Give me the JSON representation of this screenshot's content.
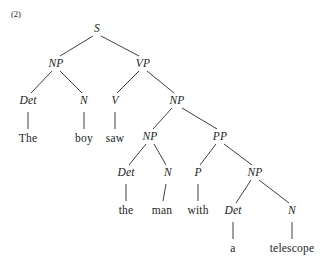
{
  "figure": {
    "example_number": "(2)",
    "sentence": "The boy saw the man with a telescope",
    "ink_color": "#1d1d1d",
    "line_color": "#2a2a2a",
    "background_color": "#ffffff"
  },
  "nodes": {
    "s": {
      "label": "S",
      "x": 97,
      "y": 29,
      "kind": "nonterminal"
    },
    "np1": {
      "label": "NP",
      "x": 56,
      "y": 64,
      "kind": "nonterminal"
    },
    "vp": {
      "label": "VP",
      "x": 143,
      "y": 64,
      "kind": "nonterminal"
    },
    "det1": {
      "label": "Det",
      "x": 28,
      "y": 101,
      "kind": "nonterminal"
    },
    "n1": {
      "label": "N",
      "x": 84,
      "y": 101,
      "kind": "nonterminal"
    },
    "v": {
      "label": "V",
      "x": 115,
      "y": 101,
      "kind": "nonterminal"
    },
    "np2": {
      "label": "NP",
      "x": 177,
      "y": 101,
      "kind": "nonterminal"
    },
    "the1": {
      "label": "The",
      "x": 28,
      "y": 139,
      "kind": "terminal"
    },
    "boy": {
      "label": "boy",
      "x": 84,
      "y": 139,
      "kind": "terminal"
    },
    "saw": {
      "label": "saw",
      "x": 115,
      "y": 139,
      "kind": "terminal"
    },
    "np3": {
      "label": "NP",
      "x": 150,
      "y": 137,
      "kind": "nonterminal"
    },
    "pp": {
      "label": "PP",
      "x": 220,
      "y": 137,
      "kind": "nonterminal"
    },
    "det2": {
      "label": "Det",
      "x": 126,
      "y": 173,
      "kind": "nonterminal"
    },
    "n2": {
      "label": "N",
      "x": 168,
      "y": 173,
      "kind": "nonterminal"
    },
    "p": {
      "label": "P",
      "x": 198,
      "y": 173,
      "kind": "nonterminal"
    },
    "np4": {
      "label": "NP",
      "x": 255,
      "y": 173,
      "kind": "nonterminal"
    },
    "the2": {
      "label": "the",
      "x": 126,
      "y": 211,
      "kind": "terminal"
    },
    "man": {
      "label": "man",
      "x": 162,
      "y": 211,
      "kind": "terminal"
    },
    "with": {
      "label": "with",
      "x": 198,
      "y": 211,
      "kind": "terminal"
    },
    "det3": {
      "label": "Det",
      "x": 233,
      "y": 211,
      "kind": "nonterminal"
    },
    "n3": {
      "label": "N",
      "x": 292,
      "y": 211,
      "kind": "nonterminal"
    },
    "a": {
      "label": "a",
      "x": 233,
      "y": 249,
      "kind": "terminal"
    },
    "telescope": {
      "label": "telescope",
      "x": 292,
      "y": 249,
      "kind": "terminal"
    }
  },
  "edges": [
    {
      "from": "s",
      "to": "np1",
      "x1": 93,
      "y1": 36,
      "x2": 60,
      "y2": 56
    },
    {
      "from": "s",
      "to": "vp",
      "x1": 101,
      "y1": 36,
      "x2": 139,
      "y2": 56
    },
    {
      "from": "np1",
      "to": "det1",
      "x1": 52,
      "y1": 71,
      "x2": 31,
      "y2": 93
    },
    {
      "from": "np1",
      "to": "n1",
      "x1": 60,
      "y1": 71,
      "x2": 82,
      "y2": 93
    },
    {
      "from": "vp",
      "to": "v",
      "x1": 139,
      "y1": 71,
      "x2": 117,
      "y2": 93
    },
    {
      "from": "vp",
      "to": "np2",
      "x1": 147,
      "y1": 71,
      "x2": 174,
      "y2": 93
    },
    {
      "from": "det1",
      "to": "the1",
      "x1": 28,
      "y1": 112,
      "x2": 28,
      "y2": 129
    },
    {
      "from": "n1",
      "to": "boy",
      "x1": 84,
      "y1": 112,
      "x2": 84,
      "y2": 129
    },
    {
      "from": "v",
      "to": "saw",
      "x1": 115,
      "y1": 112,
      "x2": 115,
      "y2": 129
    },
    {
      "from": "np2",
      "to": "np3",
      "x1": 172,
      "y1": 108,
      "x2": 153,
      "y2": 129
    },
    {
      "from": "np2",
      "to": "pp",
      "x1": 182,
      "y1": 108,
      "x2": 217,
      "y2": 129
    },
    {
      "from": "np3",
      "to": "det2",
      "x1": 146,
      "y1": 144,
      "x2": 129,
      "y2": 165
    },
    {
      "from": "np3",
      "to": "n2",
      "x1": 154,
      "y1": 144,
      "x2": 166,
      "y2": 165
    },
    {
      "from": "pp",
      "to": "p",
      "x1": 216,
      "y1": 144,
      "x2": 200,
      "y2": 165
    },
    {
      "from": "pp",
      "to": "np4",
      "x1": 224,
      "y1": 144,
      "x2": 252,
      "y2": 165
    },
    {
      "from": "det2",
      "to": "the2",
      "x1": 126,
      "y1": 184,
      "x2": 126,
      "y2": 201
    },
    {
      "from": "n2",
      "to": "man",
      "x1": 166,
      "y1": 184,
      "x2": 163,
      "y2": 201
    },
    {
      "from": "p",
      "to": "with",
      "x1": 198,
      "y1": 184,
      "x2": 198,
      "y2": 201
    },
    {
      "from": "np4",
      "to": "det3",
      "x1": 251,
      "y1": 180,
      "x2": 236,
      "y2": 203
    },
    {
      "from": "np4",
      "to": "n3",
      "x1": 259,
      "y1": 180,
      "x2": 289,
      "y2": 203
    },
    {
      "from": "det3",
      "to": "a",
      "x1": 233,
      "y1": 222,
      "x2": 233,
      "y2": 239
    },
    {
      "from": "n3",
      "to": "telescope",
      "x1": 292,
      "y1": 222,
      "x2": 292,
      "y2": 239
    }
  ]
}
